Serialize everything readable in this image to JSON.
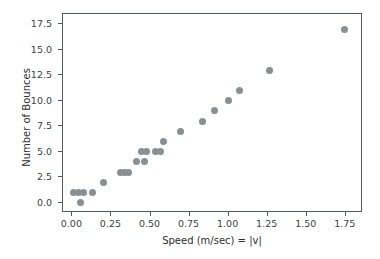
{
  "chart_data": {
    "type": "scatter",
    "title": "",
    "xlabel": "Speed (m/sec) = |v|",
    "ylabel": "Number of Bounces",
    "xlim": [
      -0.06,
      1.86
    ],
    "ylim": [
      -1.0,
      18.5
    ],
    "grid": false,
    "legend": null,
    "marker": {
      "color": "#8a8f93",
      "size": 7,
      "shape": "circle"
    },
    "xticks": [
      0.0,
      0.25,
      0.5,
      0.75,
      1.0,
      1.25,
      1.5,
      1.75
    ],
    "xticklabels": [
      "0.00",
      "0.25",
      "0.50",
      "0.75",
      "1.00",
      "1.25",
      "1.50",
      "1.75"
    ],
    "yticks": [
      0.0,
      2.5,
      5.0,
      7.5,
      10.0,
      12.5,
      15.0,
      17.5
    ],
    "yticklabels": [
      "0.0",
      "2.5",
      "5.0",
      "7.5",
      "10.0",
      "12.5",
      "15.0",
      "17.5"
    ],
    "points": [
      {
        "x": 0.05,
        "y": 0
      },
      {
        "x": 0.01,
        "y": 1
      },
      {
        "x": 0.04,
        "y": 1
      },
      {
        "x": 0.07,
        "y": 1
      },
      {
        "x": 0.13,
        "y": 1
      },
      {
        "x": 0.2,
        "y": 2
      },
      {
        "x": 0.31,
        "y": 3
      },
      {
        "x": 0.335,
        "y": 3
      },
      {
        "x": 0.36,
        "y": 3
      },
      {
        "x": 0.41,
        "y": 4
      },
      {
        "x": 0.46,
        "y": 4
      },
      {
        "x": 0.445,
        "y": 5
      },
      {
        "x": 0.475,
        "y": 5
      },
      {
        "x": 0.53,
        "y": 5
      },
      {
        "x": 0.565,
        "y": 5
      },
      {
        "x": 0.58,
        "y": 6
      },
      {
        "x": 0.69,
        "y": 7
      },
      {
        "x": 0.83,
        "y": 8
      },
      {
        "x": 0.91,
        "y": 9
      },
      {
        "x": 1.0,
        "y": 10
      },
      {
        "x": 1.07,
        "y": 11
      },
      {
        "x": 1.26,
        "y": 13
      },
      {
        "x": 1.74,
        "y": 17
      }
    ]
  },
  "figure": {
    "background_color": "#ffffff",
    "axes_color": "#555a5e"
  }
}
